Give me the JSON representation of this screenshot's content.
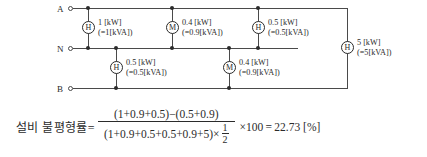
{
  "diagram": {
    "bus_labels": {
      "a": "A",
      "n": "N",
      "b": "B"
    },
    "loads_top": [
      {
        "symbol": "H",
        "power": "1 [kW]",
        "apparent": "(=1[kVA])"
      },
      {
        "symbol": "M",
        "power": "0.4 [kW]",
        "apparent": "(=0.9[kVA])"
      },
      {
        "symbol": "H",
        "power": "0.5 [kW]",
        "apparent": "(=0.5[kVA])"
      }
    ],
    "loads_bottom": [
      {
        "symbol": "H",
        "power": "0.5 [kW]",
        "apparent": "(=0.5[kVA])"
      },
      {
        "symbol": "M",
        "power": "0.4 [kW]",
        "apparent": "(=0.9[kVA])"
      }
    ],
    "load_right": {
      "symbol": "H",
      "power": "5 [kW]",
      "apparent": "(=5[kVA])"
    }
  },
  "formula": {
    "lead": "설비 불평형률=",
    "numerator": "(1+0.9+0.5)−(0.5+0.9)",
    "denominator": "(1+0.9+0.5+0.5+0.9+5)×",
    "fraction_numerator": "1",
    "fraction_denominator": "2",
    "tail": "×100 = 22.73 [%]"
  },
  "colors": {
    "line": "#4a4a4a",
    "text": "#2b2b2b",
    "background": "#ffffff"
  }
}
